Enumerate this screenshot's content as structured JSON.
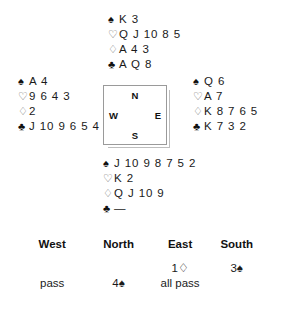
{
  "hands": {
    "north": {
      "label": "North hand",
      "rows": [
        {
          "suit": "♠",
          "suit_name": "spade-symbol",
          "style": "solid",
          "cards": "K 3"
        },
        {
          "suit": "♡",
          "suit_name": "heart-symbol",
          "style": "hollow",
          "cards": "Q J 10 8 5"
        },
        {
          "suit": "♢",
          "suit_name": "diamond-symbol",
          "style": "hollow",
          "cards": "A 4 3"
        },
        {
          "suit": "♣",
          "suit_name": "club-symbol",
          "style": "solid",
          "cards": "A Q 8"
        }
      ]
    },
    "west": {
      "label": "West hand",
      "rows": [
        {
          "suit": "♠",
          "suit_name": "spade-symbol",
          "style": "solid",
          "cards": "A 4"
        },
        {
          "suit": "♡",
          "suit_name": "heart-symbol",
          "style": "hollow",
          "cards": "9 6 4 3"
        },
        {
          "suit": "♢",
          "suit_name": "diamond-symbol",
          "style": "hollow",
          "cards": "2"
        },
        {
          "suit": "♣",
          "suit_name": "club-symbol",
          "style": "solid",
          "cards": "J 10 9 6 5 4"
        }
      ]
    },
    "east": {
      "label": "East hand",
      "rows": [
        {
          "suit": "♠",
          "suit_name": "spade-symbol",
          "style": "solid",
          "cards": "Q 6"
        },
        {
          "suit": "♡",
          "suit_name": "heart-symbol",
          "style": "hollow",
          "cards": "A 7"
        },
        {
          "suit": "♢",
          "suit_name": "diamond-symbol",
          "style": "hollow",
          "cards": "K 8 7 6 5"
        },
        {
          "suit": "♣",
          "suit_name": "club-symbol",
          "style": "solid",
          "cards": "K 7 3 2"
        }
      ]
    },
    "south": {
      "label": "South hand",
      "rows": [
        {
          "suit": "♠",
          "suit_name": "spade-symbol",
          "style": "solid",
          "cards": "J 10 9 8 7 5 2"
        },
        {
          "suit": "♡",
          "suit_name": "heart-symbol",
          "style": "hollow",
          "cards": "K 2"
        },
        {
          "suit": "♢",
          "suit_name": "diamond-symbol",
          "style": "hollow",
          "cards": "Q J 10 9"
        },
        {
          "suit": "♣",
          "suit_name": "club-symbol",
          "style": "solid",
          "cards": "—"
        }
      ]
    }
  },
  "compass": {
    "north": "N",
    "east": "E",
    "south": "S",
    "west": "W"
  },
  "auction": {
    "headers": [
      "West",
      "North",
      "East",
      "South"
    ],
    "rows": [
      {
        "west": "",
        "north": "",
        "east": "1♢",
        "south": "3♠"
      },
      {
        "west": "pass",
        "north": "4♠",
        "east": "all pass",
        "south": ""
      }
    ]
  }
}
